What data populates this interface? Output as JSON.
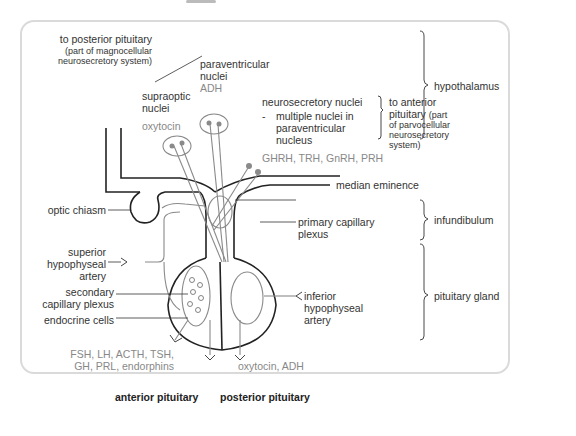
{
  "figure": {
    "labels": {
      "to_posterior_line1": "to posterior pituitary",
      "to_posterior_line2": "(part of magnocellular",
      "to_posterior_line3": "neurosecretory system)",
      "paraventricular_line1": "paraventricular",
      "paraventricular_line2": "nuclei",
      "paraventricular_hormone": "ADH",
      "supraoptic_line1": "supraoptic",
      "supraoptic_line2": "nuclei",
      "supraoptic_hormone": "oxytocin",
      "neurosecretory_title": "neurosecretory nuclei",
      "neurosecretory_dash": "-",
      "neurosecretory_line1": "multiple nuclei in",
      "neurosecretory_line2": "paraventricular",
      "neurosecretory_line3": "nucleus",
      "to_anterior_line1": "to anterior",
      "to_anterior_line2": "pituitary",
      "to_anterior_line2b": "(part",
      "to_anterior_line3": "of parvocellular",
      "to_anterior_line4": "neurosecretory",
      "to_anterior_line5": "system)",
      "releasing_hormones": "GHRH, TRH, GnRH, PRH",
      "median_eminence": "median eminence",
      "optic_chiasm": "optic chiasm",
      "primary_plexus_line1": "primary capillary",
      "primary_plexus_line2": "plexus",
      "superior_artery_line1": "superior",
      "superior_artery_line2": "hypophyseal",
      "superior_artery_line3": "artery",
      "secondary_plexus_line1": "secondary",
      "secondary_plexus_line2": "capillary plexus",
      "endocrine_cells": "endocrine cells",
      "inferior_artery_line1": "inferior",
      "inferior_artery_line2": "hypophyseal",
      "inferior_artery_line3": "artery",
      "anterior_hormones_line1": "FSH, LH, ACTH, TSH,",
      "anterior_hormones_line2": "GH, PRL, endorphins",
      "posterior_hormones": "oxytocin, ADH",
      "anterior_pituitary": "anterior pituitary",
      "posterior_pituitary": "posterior pituitary"
    },
    "regions": {
      "hypothalamus": "hypothalamus",
      "infundibulum": "infundibulum",
      "pituitary_gland": "pituitary gland"
    },
    "colors": {
      "outline": "#222222",
      "neuron": "#8a8a8a",
      "text": "#333333",
      "hormone_text": "#888888",
      "panel_border": "#dadada"
    }
  }
}
